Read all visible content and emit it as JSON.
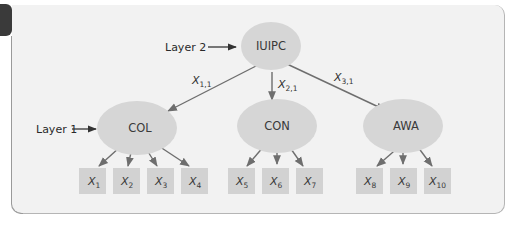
{
  "diagram": {
    "type": "hierarchical-factor-model",
    "colors": {
      "frame_fill": "#f2f2f2",
      "node_fill": "#d6d6d6",
      "box_fill": "#d2d2d2",
      "edge": "#6e6e6e",
      "tab": "#3a3a3a"
    },
    "layer_labels": {
      "layer2": "Layer 2",
      "layer1": "Layer 1"
    },
    "top_node": {
      "label": "IUIPC"
    },
    "factors": [
      {
        "label": "COL",
        "edge_label": {
          "main": "X",
          "sub": "1,1"
        },
        "indicators": [
          {
            "main": "X",
            "sub": "1"
          },
          {
            "main": "X",
            "sub": "2"
          },
          {
            "main": "X",
            "sub": "3"
          },
          {
            "main": "X",
            "sub": "4"
          }
        ]
      },
      {
        "label": "CON",
        "edge_label": {
          "main": "X",
          "sub": "2,1"
        },
        "indicators": [
          {
            "main": "X",
            "sub": "5"
          },
          {
            "main": "X",
            "sub": "6"
          },
          {
            "main": "X",
            "sub": "7"
          }
        ]
      },
      {
        "label": "AWA",
        "edge_label": {
          "main": "X",
          "sub": "3,1"
        },
        "indicators": [
          {
            "main": "X",
            "sub": "8"
          },
          {
            "main": "X",
            "sub": "9"
          },
          {
            "main": "X",
            "sub": "10"
          }
        ]
      }
    ]
  }
}
